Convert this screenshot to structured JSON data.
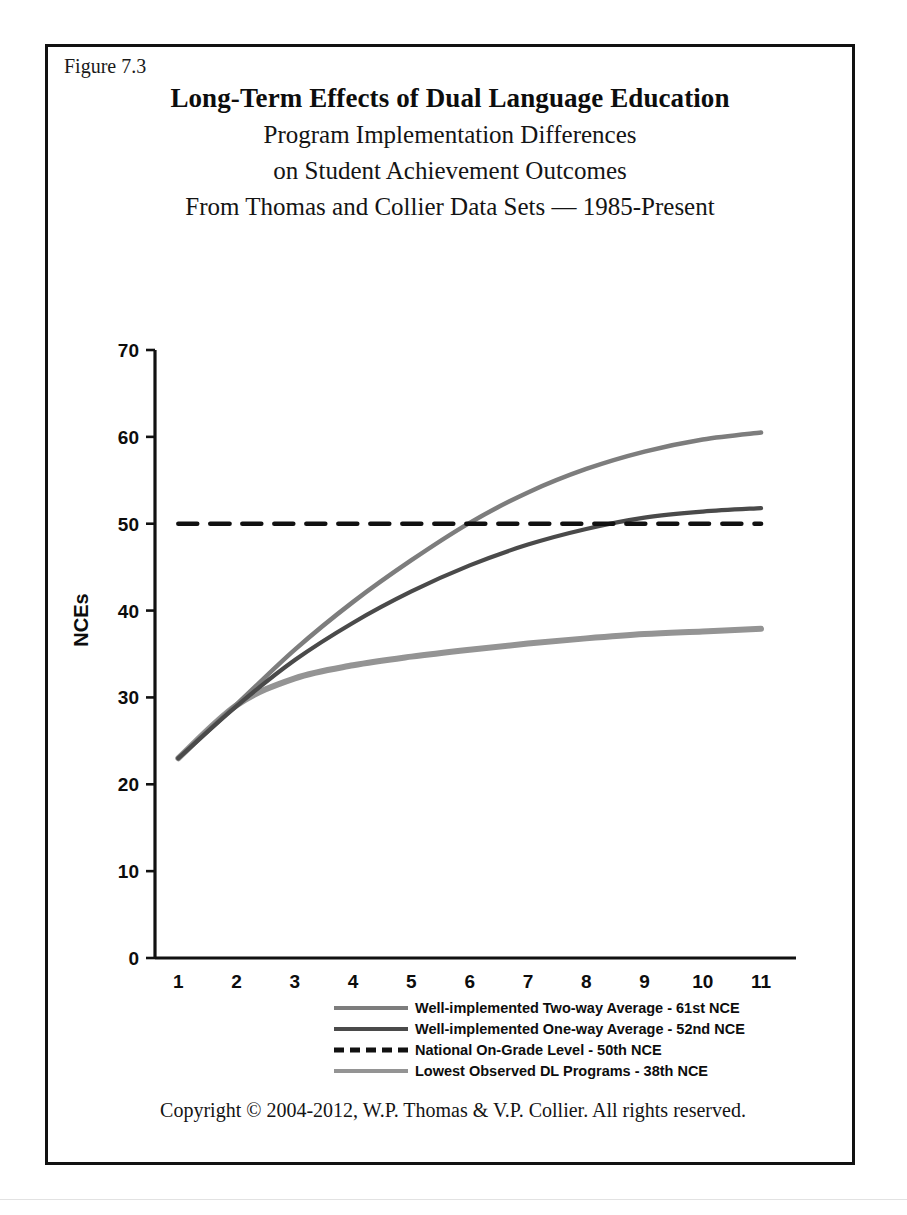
{
  "figure": {
    "number_label": "Figure 7.3",
    "title_main": "Long-Term Effects of Dual Language Education",
    "title_sub_1": "Program Implementation Differences",
    "title_sub_2": "on Student Achievement Outcomes",
    "title_sub_3": "From Thomas and Collier Data Sets — 1985-Present",
    "copyright": "Copyright © 2004-2012, W.P. Thomas & V.P. Collier.  All rights reserved.",
    "border_color": "#111111",
    "background_color": "#ffffff"
  },
  "chart_data": {
    "type": "line",
    "title": "Long-Term Effects of Dual Language Education",
    "subtitle": "Program Implementation Differences on Student Achievement Outcomes — From Thomas and Collier Data Sets — 1985-Present",
    "xlabel": "Grade",
    "ylabel": "NCEs",
    "x": [
      1,
      2,
      3,
      4,
      5,
      6,
      7,
      8,
      9,
      10,
      11
    ],
    "xticklabels": [
      "1",
      "2",
      "3",
      "4",
      "5",
      "6",
      "7",
      "8",
      "9",
      "10",
      "11"
    ],
    "xlim": [
      0.6,
      11.6
    ],
    "ylim": [
      0,
      70
    ],
    "yticks": [
      0,
      10,
      20,
      30,
      40,
      50,
      60,
      70
    ],
    "yticklabels": [
      "0",
      "10",
      "20",
      "30",
      "40",
      "50",
      "60",
      "70"
    ],
    "grid": false,
    "legend_position": "below-axes",
    "series": [
      {
        "name": "Well-implemented Two-way Average - 61st NCE",
        "color": "#7d7d7d",
        "linestyle": "solid",
        "linewidth": 4.5,
        "values": [
          23.0,
          29.2,
          35.5,
          41.0,
          45.8,
          50.1,
          53.6,
          56.3,
          58.3,
          59.7,
          60.5
        ]
      },
      {
        "name": "Well-implemented One-way Average - 52nd NCE",
        "color": "#4a4a4a",
        "linestyle": "solid",
        "linewidth": 4.2,
        "values": [
          23.0,
          29.0,
          34.3,
          38.6,
          42.2,
          45.2,
          47.6,
          49.4,
          50.7,
          51.4,
          51.8
        ]
      },
      {
        "name": "National On-Grade Level - 50th NCE",
        "color": "#111111",
        "linestyle": "dashed",
        "linewidth": 4.5,
        "values": [
          50,
          50,
          50,
          50,
          50,
          50,
          50,
          50,
          50,
          50,
          50
        ]
      },
      {
        "name": "Lowest Observed DL Programs - 38th NCE",
        "color": "#949494",
        "linestyle": "solid",
        "linewidth": 6.0,
        "values": [
          23.0,
          29.1,
          32.2,
          33.7,
          34.7,
          35.5,
          36.2,
          36.8,
          37.3,
          37.6,
          37.9
        ]
      }
    ],
    "legend": [
      {
        "label": "Well-implemented Two-way Average - 61st NCE",
        "color": "#7d7d7d",
        "linestyle": "solid"
      },
      {
        "label": "Well-implemented One-way Average - 52nd NCE",
        "color": "#4a4a4a",
        "linestyle": "solid"
      },
      {
        "label": "National On-Grade Level - 50th NCE",
        "color": "#111111",
        "linestyle": "dashed"
      },
      {
        "label": "Lowest Observed DL Programs - 38th NCE",
        "color": "#949494",
        "linestyle": "solid"
      }
    ]
  }
}
